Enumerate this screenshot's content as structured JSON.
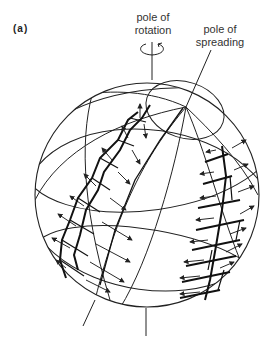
{
  "figure": {
    "panel_label": "(a)",
    "labels": {
      "pole_of_rotation": [
        "pole of",
        "rotation"
      ],
      "pole_of_spreading": [
        "pole of",
        "spreading"
      ]
    },
    "colors": {
      "line": "#222222",
      "background": "#ffffff"
    }
  }
}
